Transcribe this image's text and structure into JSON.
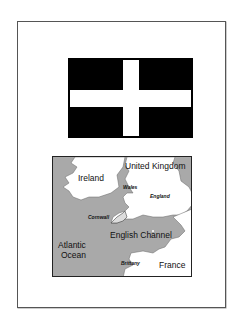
{
  "flag": {
    "name": "Saint Piran's Flag",
    "colors": {
      "field": "#000000",
      "cross": "#ffffff"
    }
  },
  "map": {
    "colors": {
      "sea": "#a9a9a9",
      "land": "#ffffff",
      "border": "#222222"
    },
    "labels": {
      "ireland": "Ireland",
      "united_kingdom": "United Kingdom",
      "wales": "Wales",
      "england": "England",
      "cornwall": "Cornwall",
      "english_channel": "English Channel",
      "atlantic_line1": "Atlantic",
      "atlantic_line2": "Ocean",
      "brittany": "Brittany",
      "france": "France"
    }
  }
}
